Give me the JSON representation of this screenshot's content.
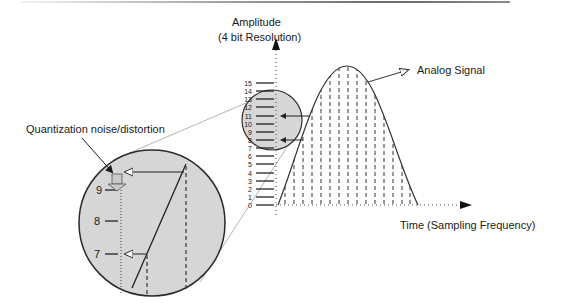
{
  "diagram": {
    "y_axis": {
      "title_line1": "Amplitude",
      "title_line2": "(4 bit Resolution)",
      "ticks": [
        "0",
        "1",
        "2",
        "3",
        "4",
        "5",
        "6",
        "7",
        "8",
        "9",
        "10",
        "11",
        "12",
        "13",
        "14",
        "15"
      ]
    },
    "x_axis": {
      "title": "Time (Sampling Frequency)"
    },
    "signal_label": "Analog Signal",
    "callout_label": "Quantization noise/distortion",
    "magnified_ticks": [
      "9",
      "8",
      "7"
    ],
    "colors": {
      "circle_fill": "#d6d6d6",
      "line": "#2a2a2a",
      "guide": "#b0b0b0"
    }
  }
}
